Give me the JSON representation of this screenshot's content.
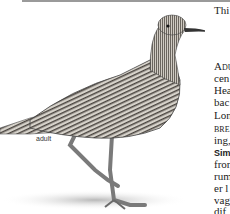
{
  "figure": {
    "label": "adult"
  },
  "text_column": {
    "intro": "Thi",
    "lines": [
      {
        "text": "Adu",
        "style": "small-caps"
      },
      {
        "text": "cen",
        "style": "normal"
      },
      {
        "text": "Hea",
        "style": "normal"
      },
      {
        "text": "bac",
        "style": "normal"
      },
      {
        "text": "Lon",
        "style": "normal"
      },
      {
        "text": "bre",
        "style": "small-caps"
      },
      {
        "text": "ing,",
        "style": "normal"
      },
      {
        "text": "Simi",
        "style": "bold-sans"
      },
      {
        "text": "fron",
        "style": "normal"
      },
      {
        "text": "rum",
        "style": "normal"
      },
      {
        "text": "er l",
        "style": "normal"
      },
      {
        "text": "vag",
        "style": "normal"
      },
      {
        "text": "dif",
        "style": "normal"
      }
    ]
  },
  "colors": {
    "rule": "#9a9a9a",
    "text": "#222222",
    "bird_dark": "#3a3a3a",
    "bird_mid": "#8a8a8a",
    "shadow": "#c8c8c8"
  }
}
